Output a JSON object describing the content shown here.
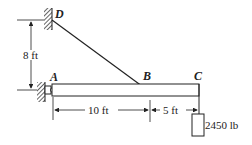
{
  "diagram": {
    "points": {
      "A": "A",
      "B": "B",
      "C": "C",
      "D": "D"
    },
    "dimensions": {
      "vertical_DA": "8 ft",
      "horizontal_AB": "10 ft",
      "horizontal_BC": "5 ft"
    },
    "load": {
      "label": "2450 lb"
    },
    "colors": {
      "ink": "#222222",
      "background": "#ffffff"
    }
  }
}
